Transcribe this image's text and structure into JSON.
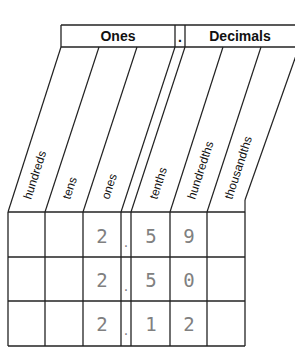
{
  "header": {
    "ones_label": "Ones",
    "point_label": ".",
    "decimals_label": "Decimals"
  },
  "columns": [
    {
      "label": "hundreds"
    },
    {
      "label": "tens"
    },
    {
      "label": "ones"
    },
    {
      "label": ""
    },
    {
      "label": "tenths"
    },
    {
      "label": "hundredths"
    },
    {
      "label": "thousandths"
    }
  ],
  "rows": [
    {
      "cells": [
        "",
        "",
        "2",
        ".",
        "5",
        "9",
        ""
      ]
    },
    {
      "cells": [
        "",
        "",
        "2",
        ".",
        "5",
        "0",
        ""
      ]
    },
    {
      "cells": [
        "",
        "",
        "2",
        ".",
        "1",
        "2",
        ""
      ]
    }
  ],
  "colors": {
    "line": "#222222",
    "digits": "#808080"
  }
}
